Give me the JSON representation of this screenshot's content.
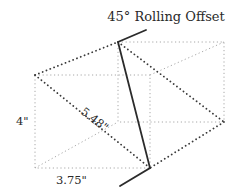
{
  "diagram": {
    "title": "45° Rolling Offset",
    "labels": {
      "rise": "4\"",
      "travel": "5.48\"",
      "offset": "3.75\""
    },
    "colors": {
      "pipe": "#2b2b2b",
      "dark_dots": "#3a3a3a",
      "faint_dots": "#a8a8a8",
      "text": "#2a2a2a"
    }
  }
}
